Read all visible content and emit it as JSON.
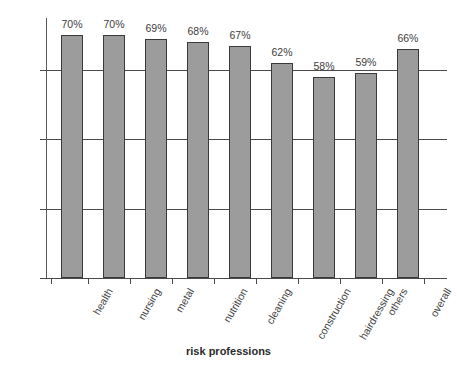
{
  "axes": {
    "x_title": "risk professions",
    "y_ticks": [
      "0%",
      "20%",
      "40%",
      "60%"
    ]
  },
  "bar_labels": [
    "70%",
    "70%",
    "69%",
    "68%",
    "67%",
    "62%",
    "58%",
    "59%",
    "66%"
  ],
  "categories": [
    "health",
    "nursing",
    "metal",
    "nutrition",
    "cleaning",
    "construction",
    "hairdressing",
    "others",
    "overall"
  ],
  "colors": {
    "bar_fill": "#9c9c9c",
    "bar_border": "#3a3a3a",
    "axis": "#4a4a4a",
    "text": "#3d3d3d"
  },
  "chart_data": {
    "type": "bar",
    "title": "",
    "xlabel": "risk professions",
    "ylabel": "",
    "categories": [
      "health",
      "nursing",
      "metal",
      "nutrition",
      "cleaning",
      "construction",
      "hairdressing",
      "others",
      "overall"
    ],
    "values": [
      70,
      70,
      69,
      68,
      67,
      62,
      58,
      59,
      66
    ],
    "value_labels": [
      "70%",
      "70%",
      "69%",
      "68%",
      "67%",
      "62%",
      "58%",
      "59%",
      "66%"
    ],
    "ylim": [
      0,
      75
    ],
    "yticks": [
      0,
      20,
      40,
      60
    ],
    "ytick_labels": [
      "0%",
      "20%",
      "40%",
      "60%"
    ],
    "grid": true,
    "grid_axis": "y",
    "legend": false,
    "unit": "percent",
    "series": [
      {
        "name": "share",
        "values": [
          70,
          70,
          69,
          68,
          67,
          62,
          58,
          59,
          66
        ]
      }
    ]
  }
}
